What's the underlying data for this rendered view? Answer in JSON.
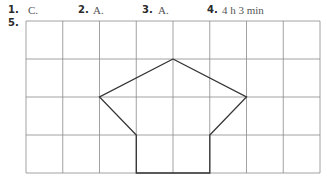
{
  "answers": [
    {
      "number": "1.",
      "answer": "C."
    },
    {
      "number": "2.",
      "answer": "A."
    },
    {
      "number": "3.",
      "answer": "A."
    },
    {
      "number": "4.",
      "answer": "4 h 3 min"
    }
  ],
  "question5": {
    "number": "5.",
    "grid": {
      "columns": 8,
      "rows": 4,
      "line_color": "#8a8a8a"
    },
    "shape": {
      "description": "pentagon-roofed house outline on grid",
      "vertices_grid_units": [
        [
          4,
          1
        ],
        [
          6,
          2
        ],
        [
          5,
          3
        ],
        [
          5,
          4
        ],
        [
          3,
          4
        ],
        [
          3,
          3
        ],
        [
          2,
          2
        ]
      ],
      "stroke_color": "#333333"
    }
  }
}
